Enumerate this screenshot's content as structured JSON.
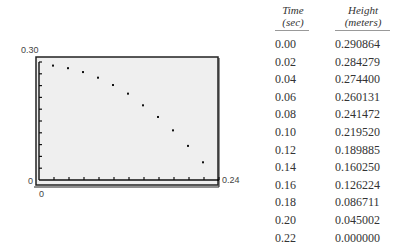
{
  "chart_data": {
    "type": "scatter",
    "title": "",
    "xlabel": "",
    "ylabel": "",
    "xlim": [
      0,
      0.24
    ],
    "ylim": [
      0,
      0.3
    ],
    "x_tick_step": 0.02,
    "y_tick_step": 0.03,
    "grid": false,
    "axis_labels": {
      "y_max": "0.30",
      "y_min": "0",
      "x_min": "0",
      "x_max": "0.24"
    },
    "series": [
      {
        "name": "Height vs Time",
        "x": [
          0.0,
          0.02,
          0.04,
          0.06,
          0.08,
          0.1,
          0.12,
          0.14,
          0.16,
          0.18,
          0.2,
          0.22
        ],
        "y": [
          0.290864,
          0.284279,
          0.2744,
          0.260131,
          0.241472,
          0.21952,
          0.189885,
          0.16025,
          0.126224,
          0.086711,
          0.045002,
          0.0
        ]
      }
    ]
  },
  "table": {
    "headers": [
      {
        "line1": "Time",
        "line2": "(sec)"
      },
      {
        "line1": "Height",
        "line2": "(meters)"
      }
    ],
    "rows": [
      [
        "0.00",
        "0.290864"
      ],
      [
        "0.02",
        "0.284279"
      ],
      [
        "0.04",
        "0.274400"
      ],
      [
        "0.06",
        "0.260131"
      ],
      [
        "0.08",
        "0.241472"
      ],
      [
        "0.10",
        "0.219520"
      ],
      [
        "0.12",
        "0.189885"
      ],
      [
        "0.14",
        "0.160250"
      ],
      [
        "0.16",
        "0.126224"
      ],
      [
        "0.18",
        "0.086711"
      ],
      [
        "0.20",
        "0.045002"
      ],
      [
        "0.22",
        "0.000000"
      ]
    ]
  }
}
